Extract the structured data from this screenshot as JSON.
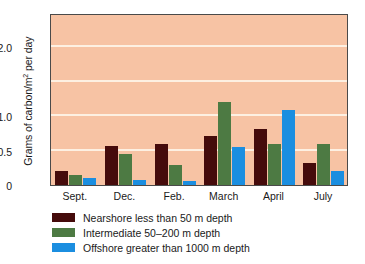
{
  "chart_data": {
    "type": "bar",
    "title": "",
    "xlabel": "",
    "ylabel": "Grams of carbon/m2 per day",
    "ylabel_prefix": "Grams of carbon/m",
    "ylabel_superscript": "2",
    "ylabel_suffix": " per day",
    "categories": [
      "Sept.",
      "Dec.",
      "Feb.",
      "March",
      "April",
      "July"
    ],
    "series": [
      {
        "name": "Nearshore less than 50 m depth",
        "color": "#450b0b",
        "values": [
          0.2,
          0.57,
          0.6,
          0.72,
          0.82,
          0.32
        ]
      },
      {
        "name": "Intermediate 50–200 m depth",
        "color": "#4d7a43",
        "values": [
          0.15,
          0.45,
          0.29,
          1.22,
          0.6,
          0.6
        ]
      },
      {
        "name": "Offshore greater than 1000 m depth",
        "color": "#1b8ee0",
        "values": [
          0.11,
          0.07,
          0.06,
          0.56,
          1.1,
          0.2
        ]
      }
    ],
    "ylim": [
      0,
      2.5
    ],
    "yticks": [
      0,
      0.5,
      1.0,
      2.0
    ],
    "ytick_labels": [
      "0",
      "0.5",
      "1.0",
      "2.0"
    ],
    "gridlines": [
      0.5,
      1.0,
      1.5,
      2.0
    ],
    "grid": true,
    "grid_color": "#fdf0e2",
    "plot_background": "#f7c3a4",
    "legend_position": "below-left",
    "legend": [
      "Nearshore less than 50 m depth",
      "Intermediate 50–200 m depth",
      "Offshore greater than 1000 m depth"
    ]
  }
}
